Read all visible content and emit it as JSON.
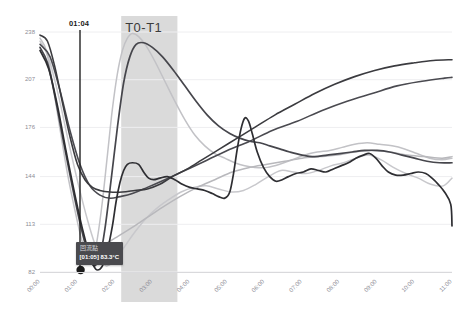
{
  "chart_data": {
    "type": "line",
    "title": "",
    "subtitle": "",
    "xlabel": "",
    "ylabel": "",
    "grid": true,
    "legend_position": "none",
    "ylim": [
      82,
      238
    ],
    "ytick_labels": [
      "238",
      "207",
      "176",
      "144",
      "113",
      "82"
    ],
    "ytick_values": [
      238,
      207,
      176,
      144,
      113,
      82
    ],
    "xtick_labels": [
      "00:00",
      "01:00",
      "02:00",
      "03:00",
      "04:00",
      "05:00",
      "06:00",
      "07:00",
      "08:00",
      "09:00",
      "10:00",
      "11:00"
    ],
    "x_range": [
      "00:00",
      "11:40"
    ],
    "annotations": [
      {
        "name": "vertical-marker",
        "label": "01:04",
        "x": "01:04",
        "type": "vline"
      },
      {
        "name": "shaded-band",
        "label": "T0-T1",
        "x_start": "02:10",
        "x_end": "03:40",
        "type": "vspan",
        "color": "#cccccc"
      },
      {
        "name": "reflow-point",
        "label": "回流點",
        "value_label": "[01:05] 83.3°C",
        "x": "01:05",
        "y": 83.3,
        "type": "point"
      }
    ],
    "series": [
      {
        "name": "series-dark-a",
        "color": "#3b3b3f",
        "width": 1.6,
        "points": [
          [
            0.0,
            236
          ],
          [
            0.6,
            232
          ],
          [
            1.2,
            215
          ],
          [
            1.8,
            192
          ],
          [
            2.4,
            170
          ],
          [
            3.0,
            152
          ],
          [
            3.6,
            142
          ],
          [
            4.2,
            137
          ],
          [
            4.8,
            135
          ],
          [
            5.6,
            134
          ],
          [
            6.6,
            134
          ],
          [
            7.6,
            135
          ],
          [
            8.6,
            136
          ],
          [
            9.6,
            139
          ],
          [
            10.6,
            144
          ],
          [
            11.8,
            149
          ],
          [
            13.0,
            155
          ],
          [
            14.4,
            162
          ],
          [
            15.8,
            169
          ],
          [
            17.2,
            176
          ],
          [
            18.8,
            184
          ],
          [
            20.4,
            191
          ],
          [
            22.0,
            198
          ],
          [
            23.6,
            204
          ],
          [
            25.2,
            209
          ],
          [
            26.8,
            213
          ],
          [
            28.4,
            216
          ],
          [
            30.0,
            218
          ],
          [
            31.5,
            219.5
          ],
          [
            33.0,
            220
          ]
        ]
      },
      {
        "name": "series-dark-b",
        "color": "#4a4a50",
        "width": 1.6,
        "points": [
          [
            0.0,
            230
          ],
          [
            0.8,
            222
          ],
          [
            1.6,
            200
          ],
          [
            2.4,
            174
          ],
          [
            3.2,
            152
          ],
          [
            4.0,
            138
          ],
          [
            4.8,
            132
          ],
          [
            5.6,
            130
          ],
          [
            6.4,
            131
          ],
          [
            7.4,
            133
          ],
          [
            8.6,
            137
          ],
          [
            10.0,
            142
          ],
          [
            11.6,
            148
          ],
          [
            13.2,
            154
          ],
          [
            15.0,
            161
          ],
          [
            16.8,
            167
          ],
          [
            18.6,
            174
          ],
          [
            20.6,
            180
          ],
          [
            22.6,
            187
          ],
          [
            24.6,
            193
          ],
          [
            26.6,
            198
          ],
          [
            28.6,
            203
          ],
          [
            30.6,
            206
          ],
          [
            32.4,
            208
          ],
          [
            33.0,
            208.5
          ]
        ]
      },
      {
        "name": "series-light-rise",
        "color": "#c2c2c6",
        "width": 1.5,
        "points": [
          [
            0.0,
            234
          ],
          [
            0.5,
            226
          ],
          [
            1.0,
            205
          ],
          [
            1.6,
            175
          ],
          [
            2.2,
            146
          ],
          [
            2.8,
            122
          ],
          [
            3.3,
            104
          ],
          [
            3.7,
            94
          ],
          [
            4.0,
            89
          ],
          [
            4.3,
            92
          ],
          [
            4.6,
            104
          ],
          [
            5.0,
            128
          ],
          [
            5.4,
            158
          ],
          [
            5.8,
            188
          ],
          [
            6.2,
            211
          ],
          [
            6.6,
            226
          ],
          [
            7.0,
            234
          ],
          [
            7.4,
            237
          ],
          [
            7.9,
            235
          ],
          [
            8.5,
            229
          ],
          [
            9.2,
            219
          ],
          [
            10.0,
            206
          ],
          [
            10.8,
            193
          ],
          [
            11.6,
            181
          ],
          [
            12.4,
            171
          ],
          [
            13.2,
            164
          ],
          [
            14.0,
            159
          ],
          [
            14.8,
            156
          ],
          [
            15.6,
            153
          ],
          [
            16.4,
            151
          ],
          [
            17.2,
            150
          ],
          [
            18.2,
            150
          ],
          [
            19.2,
            152
          ],
          [
            20.2,
            155
          ],
          [
            21.2,
            158
          ],
          [
            22.2,
            160
          ],
          [
            23.2,
            161
          ],
          [
            24.2,
            163
          ],
          [
            25.2,
            165
          ],
          [
            26.2,
            166
          ],
          [
            27.2,
            165
          ],
          [
            28.2,
            164
          ],
          [
            29.2,
            162
          ],
          [
            30.2,
            159
          ],
          [
            31.2,
            156
          ],
          [
            32.2,
            155
          ],
          [
            33.0,
            156
          ]
        ]
      },
      {
        "name": "series-dark-peak",
        "color": "#46464c",
        "width": 1.7,
        "points": [
          [
            0.0,
            228
          ],
          [
            0.6,
            218
          ],
          [
            1.2,
            196
          ],
          [
            1.9,
            166
          ],
          [
            2.6,
            137
          ],
          [
            3.2,
            114
          ],
          [
            3.7,
            98
          ],
          [
            4.1,
            89
          ],
          [
            4.4,
            86
          ],
          [
            4.8,
            92
          ],
          [
            5.2,
            110
          ],
          [
            5.7,
            142
          ],
          [
            6.2,
            176
          ],
          [
            6.7,
            205
          ],
          [
            7.2,
            222
          ],
          [
            7.7,
            230
          ],
          [
            8.3,
            231
          ],
          [
            9.0,
            228
          ],
          [
            9.8,
            222
          ],
          [
            10.7,
            213
          ],
          [
            11.6,
            203
          ],
          [
            12.5,
            193
          ],
          [
            13.4,
            184
          ],
          [
            14.3,
            177
          ],
          [
            15.2,
            172
          ],
          [
            16.0,
            169
          ],
          [
            16.8,
            167
          ],
          [
            17.6,
            166
          ],
          [
            18.4,
            164
          ],
          [
            19.2,
            162
          ],
          [
            20.0,
            160
          ],
          [
            21.0,
            158
          ],
          [
            22.0,
            157
          ],
          [
            23.0,
            158
          ],
          [
            24.0,
            159
          ],
          [
            25.0,
            160
          ],
          [
            26.0,
            161
          ],
          [
            27.0,
            161
          ],
          [
            28.0,
            160
          ],
          [
            29.0,
            158
          ],
          [
            30.0,
            156
          ],
          [
            31.0,
            154
          ],
          [
            32.0,
            153
          ],
          [
            33.0,
            153
          ]
        ]
      },
      {
        "name": "series-dark-spike",
        "color": "#2e2e32",
        "width": 1.7,
        "points": [
          [
            0.0,
            226
          ],
          [
            0.7,
            214
          ],
          [
            1.4,
            190
          ],
          [
            2.1,
            160
          ],
          [
            2.8,
            132
          ],
          [
            3.4,
            110
          ],
          [
            3.9,
            95
          ],
          [
            4.3,
            86
          ],
          [
            4.6,
            83.3
          ],
          [
            5.0,
            86
          ],
          [
            5.4,
            96
          ],
          [
            5.8,
            112
          ],
          [
            6.1,
            128
          ],
          [
            6.4,
            140
          ],
          [
            6.7,
            148
          ],
          [
            7.0,
            152
          ],
          [
            7.4,
            153
          ],
          [
            7.9,
            152
          ],
          [
            8.3,
            147
          ],
          [
            8.7,
            143
          ],
          [
            9.1,
            142
          ],
          [
            9.6,
            143
          ],
          [
            10.2,
            144
          ],
          [
            10.8,
            142
          ],
          [
            11.4,
            139
          ],
          [
            12.0,
            137
          ],
          [
            12.6,
            136
          ],
          [
            13.2,
            135
          ],
          [
            13.8,
            133
          ],
          [
            14.3,
            131
          ],
          [
            14.8,
            130
          ],
          [
            15.2,
            134
          ],
          [
            15.5,
            146
          ],
          [
            15.8,
            162
          ],
          [
            16.1,
            175
          ],
          [
            16.4,
            182
          ],
          [
            16.7,
            180
          ],
          [
            17.0,
            172
          ],
          [
            17.4,
            160
          ],
          [
            17.9,
            150
          ],
          [
            18.4,
            144
          ],
          [
            18.9,
            141
          ],
          [
            19.4,
            142
          ],
          [
            19.9,
            144
          ],
          [
            20.5,
            146
          ],
          [
            21.1,
            147
          ],
          [
            21.7,
            149
          ],
          [
            22.3,
            148
          ],
          [
            22.9,
            147
          ],
          [
            23.5,
            149
          ],
          [
            24.1,
            151
          ],
          [
            24.7,
            153
          ],
          [
            25.3,
            156
          ],
          [
            25.9,
            158
          ],
          [
            26.4,
            159
          ],
          [
            26.9,
            156
          ],
          [
            27.4,
            151
          ],
          [
            27.9,
            147
          ],
          [
            28.5,
            145
          ],
          [
            29.1,
            145
          ],
          [
            29.7,
            146
          ],
          [
            30.3,
            147
          ],
          [
            30.9,
            146
          ],
          [
            31.4,
            143
          ],
          [
            31.9,
            139
          ],
          [
            32.4,
            134
          ],
          [
            32.9,
            126
          ],
          [
            33.0,
            112
          ]
        ]
      },
      {
        "name": "series-light-low",
        "color": "#c8c8cc",
        "width": 1.5,
        "points": [
          [
            0.0,
            232
          ],
          [
            0.7,
            221
          ],
          [
            1.5,
            196
          ],
          [
            2.3,
            166
          ],
          [
            3.1,
            138
          ],
          [
            3.8,
            116
          ],
          [
            4.4,
            100
          ],
          [
            4.9,
            90
          ],
          [
            5.3,
            86
          ],
          [
            5.8,
            88
          ],
          [
            6.3,
            93
          ],
          [
            6.9,
            100
          ],
          [
            7.6,
            108
          ],
          [
            8.4,
            116
          ],
          [
            9.3,
            123
          ],
          [
            10.3,
            129
          ],
          [
            11.3,
            134
          ],
          [
            12.3,
            137
          ],
          [
            13.3,
            138
          ],
          [
            14.3,
            136
          ],
          [
            15.3,
            134
          ],
          [
            16.3,
            135
          ],
          [
            17.3,
            139
          ],
          [
            18.3,
            144
          ],
          [
            19.3,
            148
          ],
          [
            20.3,
            147
          ],
          [
            21.3,
            146
          ],
          [
            22.3,
            148
          ],
          [
            23.3,
            151
          ],
          [
            24.3,
            153
          ],
          [
            25.3,
            156
          ],
          [
            26.3,
            158
          ],
          [
            27.3,
            155
          ],
          [
            28.3,
            150
          ],
          [
            29.3,
            146
          ],
          [
            30.3,
            143
          ],
          [
            31.3,
            139
          ],
          [
            32.3,
            138
          ],
          [
            33.0,
            143
          ]
        ]
      },
      {
        "name": "series-light-mid",
        "color": "#b8b8bc",
        "width": 1.5,
        "points": [
          [
            4.0,
            95
          ],
          [
            5.0,
            99
          ],
          [
            6.0,
            104
          ],
          [
            7.2,
            110
          ],
          [
            8.5,
            117
          ],
          [
            9.8,
            124
          ],
          [
            11.2,
            131
          ],
          [
            12.6,
            137
          ],
          [
            14.0,
            142
          ],
          [
            15.4,
            147
          ],
          [
            16.8,
            150
          ],
          [
            18.2,
            152
          ],
          [
            19.6,
            154
          ],
          [
            21.0,
            156
          ],
          [
            22.4,
            157
          ],
          [
            23.8,
            158
          ],
          [
            25.2,
            160
          ],
          [
            26.6,
            161
          ],
          [
            28.0,
            160
          ],
          [
            29.4,
            158
          ],
          [
            30.8,
            157
          ],
          [
            32.2,
            156
          ],
          [
            33.0,
            157
          ]
        ]
      }
    ]
  },
  "axis": {
    "y_label_color": "#8d8d96",
    "x_label_color": "#8d8d96",
    "grid_color": "#eeeef0"
  },
  "tooltip": {
    "title": "回流點",
    "value": "[01:05] 83.3°C",
    "background": "#4a4a4e"
  },
  "band": {
    "label": "T0-T1",
    "color": "#cccccc"
  },
  "vmarker": {
    "label": "01:04",
    "color": "#222222"
  }
}
